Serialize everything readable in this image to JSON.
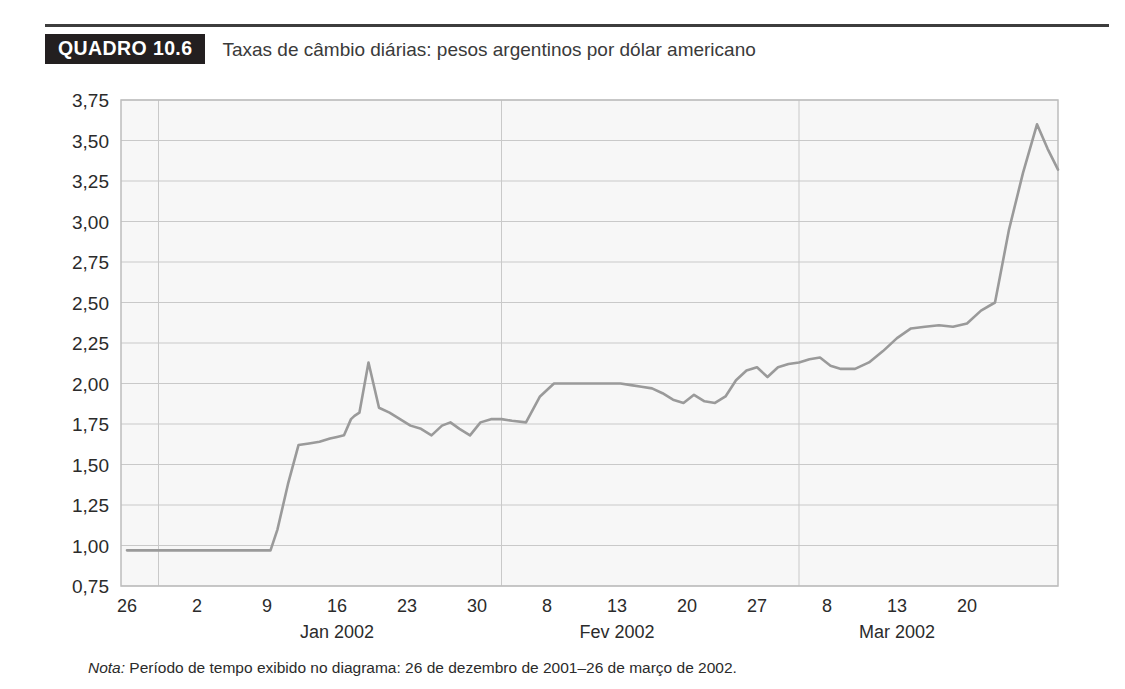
{
  "caption": {
    "tag": "QUADRO 10.6",
    "title": "Taxas de câmbio diárias: pesos argentinos por dólar americano"
  },
  "note": {
    "label": "Nota:",
    "text": " Período de tempo exibido no diagrama: 26 de dezembro de 2001–26 de março de 2002."
  },
  "colors": {
    "tag_bg": "#231f20",
    "tag_fg": "#ffffff",
    "rule": "#3d3d3d",
    "line": "#9a9a9a",
    "grid": "#c9c9c9",
    "plot_bg": "#f7f7f7",
    "text": "#2b2b2b"
  },
  "chart_data": {
    "type": "line",
    "title": "Taxas de câmbio diárias: pesos argentinos por dólar americano",
    "xlabel": "",
    "ylabel": "",
    "ylim": [
      0.75,
      3.75
    ],
    "ytick_step": 0.25,
    "grid": true,
    "legend": "none",
    "ytick_labels": [
      "3,75",
      "3,50",
      "3,25",
      "3,00",
      "2,75",
      "2,50",
      "2,25",
      "2,00",
      "1,75",
      "1,50",
      "1,25",
      "1,00",
      "0,75"
    ],
    "ytick_values": [
      3.75,
      3.5,
      3.25,
      3.0,
      2.75,
      2.5,
      2.25,
      2.0,
      1.75,
      1.5,
      1.25,
      1.0,
      0.75
    ],
    "xtick_labels": [
      "26",
      "2",
      "9",
      "16",
      "23",
      "30",
      "8",
      "13",
      "20",
      "27",
      "8",
      "13",
      "20"
    ],
    "xtick_index": [
      0,
      1,
      2,
      3,
      4,
      5,
      6,
      7,
      8,
      9,
      10,
      11,
      12
    ],
    "month_labels": [
      {
        "label": "Jan 2002",
        "tick_index": 3
      },
      {
        "label": "Fev 2002",
        "tick_index": 7
      },
      {
        "label": "Mar 2002",
        "tick_index": 11
      }
    ],
    "month_dividers_tick_index": [
      0.45,
      5.35,
      9.6
    ],
    "series": [
      {
        "name": "Pesos argentinos por dólar americano",
        "color": "#9a9a9a",
        "x": [
          0.0,
          0.3,
          0.6,
          0.9,
          1.2,
          1.5,
          1.8,
          2.0,
          2.05,
          2.15,
          2.3,
          2.45,
          2.6,
          2.75,
          2.9,
          3.0,
          3.1,
          3.2,
          3.25,
          3.32,
          3.45,
          3.6,
          3.75,
          3.9,
          4.05,
          4.2,
          4.35,
          4.5,
          4.62,
          4.75,
          4.9,
          5.05,
          5.2,
          5.35,
          5.5,
          5.7,
          5.9,
          6.1,
          6.35,
          6.6,
          6.85,
          7.05,
          7.2,
          7.35,
          7.5,
          7.65,
          7.8,
          7.95,
          8.1,
          8.25,
          8.4,
          8.55,
          8.7,
          8.85,
          9.0,
          9.15,
          9.3,
          9.45,
          9.6,
          9.75,
          9.9,
          10.05,
          10.2,
          10.4,
          10.6,
          10.8,
          11.0,
          11.2,
          11.4,
          11.6,
          11.8,
          12.0,
          12.2,
          12.4,
          12.6,
          12.8,
          13.0,
          13.15,
          13.3
        ],
        "y": [
          0.97,
          0.97,
          0.97,
          0.97,
          0.97,
          0.97,
          0.97,
          0.97,
          0.97,
          1.1,
          1.38,
          1.62,
          1.63,
          1.64,
          1.66,
          1.67,
          1.68,
          1.78,
          1.8,
          1.82,
          2.13,
          1.85,
          1.82,
          1.78,
          1.74,
          1.72,
          1.68,
          1.74,
          1.76,
          1.72,
          1.68,
          1.76,
          1.78,
          1.78,
          1.77,
          1.76,
          1.92,
          2.0,
          2.0,
          2.0,
          2.0,
          2.0,
          1.99,
          1.98,
          1.97,
          1.94,
          1.9,
          1.88,
          1.93,
          1.89,
          1.88,
          1.92,
          2.02,
          2.08,
          2.1,
          2.04,
          2.1,
          2.12,
          2.13,
          2.15,
          2.16,
          2.11,
          2.09,
          2.09,
          2.13,
          2.2,
          2.28,
          2.34,
          2.35,
          2.36,
          2.35,
          2.37,
          2.45,
          2.5,
          2.95,
          3.3,
          3.6,
          3.45,
          3.32
        ]
      }
    ]
  }
}
